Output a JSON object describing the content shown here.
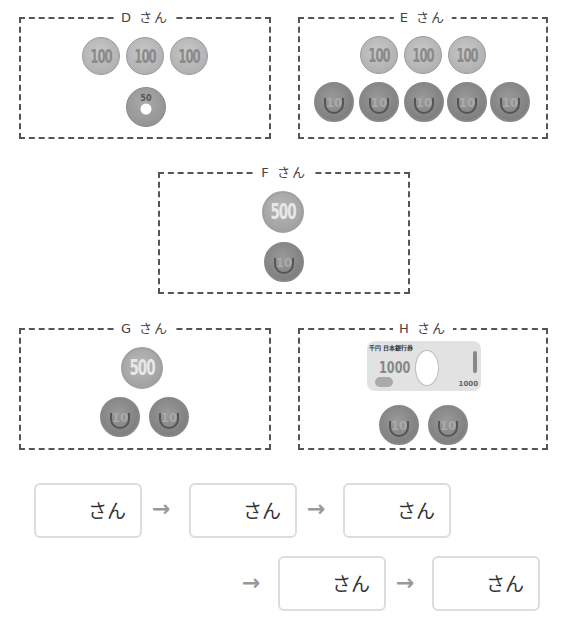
{
  "boxes": [
    {
      "id": "D",
      "label": "D さん",
      "coins": [
        "100",
        "100",
        "100",
        "50"
      ]
    },
    {
      "id": "E",
      "label": "E さん",
      "coins": [
        "100",
        "100",
        "100",
        "10",
        "10",
        "10",
        "10",
        "10"
      ]
    },
    {
      "id": "F",
      "label": "F さん",
      "coins": [
        "500",
        "10"
      ]
    },
    {
      "id": "G",
      "label": "G さん",
      "coins": [
        "500",
        "10",
        "10"
      ]
    },
    {
      "id": "H",
      "label": "H さん",
      "coins": [
        "1000-bill",
        "10",
        "10"
      ]
    }
  ],
  "coin_text": {
    "c100": "100",
    "c10": "10",
    "c50": "50",
    "c500": "500"
  },
  "bill": {
    "header": "千円 日本銀行券",
    "value": "1000",
    "small_value": "1000"
  },
  "answer_row": {
    "suffix": "さん",
    "boxes": [
      "",
      "",
      "",
      "",
      ""
    ],
    "arrow": "→"
  }
}
